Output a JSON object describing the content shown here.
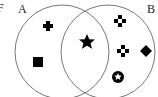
{
  "diagram": {
    "type": "venn",
    "fragment_label": "F",
    "sets": [
      {
        "label": "A",
        "only_items": [
          "plus",
          "square"
        ]
      },
      {
        "label": "B",
        "only_items": [
          "four-dot-diamond",
          "cross-dots",
          "diamond",
          "circled-star"
        ]
      }
    ],
    "intersection_items": [
      "star"
    ],
    "colors": {
      "stroke": "#777777",
      "shape": "#000000"
    }
  }
}
